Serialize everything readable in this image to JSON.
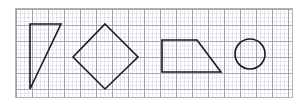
{
  "panel": {
    "name": "graph-paper-panel",
    "border_color": "#b3b3b3",
    "background_color": "#ffffff",
    "width_px": 278,
    "height_px": 90,
    "offset_x_px": 15,
    "offset_y_px": 8
  },
  "grid": {
    "major_spacing_px": 16,
    "minor_spacing_px": 8,
    "major_line_color": "#9696a5",
    "minor_line_color": "#a0a0af",
    "visible": true,
    "style": "graph-paper"
  },
  "stroke": {
    "color": "#1a1a1a",
    "width_px": 1.6,
    "fill": "none"
  },
  "shapes": [
    {
      "id": "shape-triangle",
      "name": "right-triangle",
      "label": "Right triangle",
      "type": "polygon",
      "vertex_count": 3,
      "points": "14,15 45,15 14,80",
      "bbox": {
        "x": 14,
        "y": 15,
        "width": 31,
        "height": 65
      }
    },
    {
      "id": "shape-diamond",
      "name": "diamond-rotated-square",
      "label": "Diamond",
      "type": "polygon",
      "vertex_count": 4,
      "points": "89,15 122,48 89,80 57,48",
      "bbox": {
        "x": 57,
        "y": 15,
        "width": 65,
        "height": 65
      }
    },
    {
      "id": "shape-trapezoid",
      "name": "right-trapezoid",
      "label": "Right trapezoid",
      "type": "polygon",
      "vertex_count": 4,
      "points": "146,31 181,31 205,63 146,63",
      "bbox": {
        "x": 146,
        "y": 31,
        "width": 59,
        "height": 32
      }
    },
    {
      "id": "shape-circle",
      "name": "circle",
      "label": "Circle",
      "type": "circle",
      "cx": 234,
      "cy": 45,
      "r": 15,
      "bbox": {
        "x": 219,
        "y": 30,
        "width": 30,
        "height": 30
      }
    }
  ]
}
